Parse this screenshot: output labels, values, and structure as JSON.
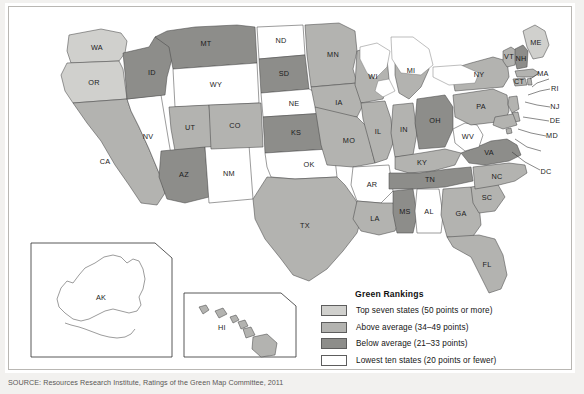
{
  "legend": {
    "title": "Green Rankings",
    "items": [
      {
        "label": "Top seven states (50 points or more)",
        "color": "#d0d0cd",
        "tier": "top7"
      },
      {
        "label": "Above average (34–49 points)",
        "color": "#b3b3b0",
        "tier": "above"
      },
      {
        "label": "Below average (21–33 points)",
        "color": "#8d8d8a",
        "tier": "below"
      },
      {
        "label": "Lowest ten states (20 points or fewer)",
        "color": "#ffffff",
        "tier": "lowest"
      }
    ]
  },
  "source": "SOURCE: Resources Research Institute, Ratings of the Green Map Committee, 2011",
  "insets": [
    {
      "name": "AK",
      "label": "AK"
    },
    {
      "name": "HI",
      "label": "HI"
    }
  ],
  "map": {
    "states": [
      {
        "code": "WA",
        "tier": "top7"
      },
      {
        "code": "OR",
        "tier": "top7"
      },
      {
        "code": "CA",
        "tier": "above"
      },
      {
        "code": "NV",
        "tier": "lowest"
      },
      {
        "code": "ID",
        "tier": "below"
      },
      {
        "code": "MT",
        "tier": "below"
      },
      {
        "code": "WY",
        "tier": "lowest"
      },
      {
        "code": "UT",
        "tier": "above"
      },
      {
        "code": "AZ",
        "tier": "below"
      },
      {
        "code": "NM",
        "tier": "lowest"
      },
      {
        "code": "CO",
        "tier": "above"
      },
      {
        "code": "ND",
        "tier": "lowest"
      },
      {
        "code": "SD",
        "tier": "below"
      },
      {
        "code": "NE",
        "tier": "lowest"
      },
      {
        "code": "KS",
        "tier": "below"
      },
      {
        "code": "OK",
        "tier": "lowest"
      },
      {
        "code": "TX",
        "tier": "above"
      },
      {
        "code": "MN",
        "tier": "above"
      },
      {
        "code": "IA",
        "tier": "above"
      },
      {
        "code": "MO",
        "tier": "above"
      },
      {
        "code": "AR",
        "tier": "lowest"
      },
      {
        "code": "LA",
        "tier": "above"
      },
      {
        "code": "WI",
        "tier": "above"
      },
      {
        "code": "IL",
        "tier": "above"
      },
      {
        "code": "MI",
        "tier": "above"
      },
      {
        "code": "IN",
        "tier": "above"
      },
      {
        "code": "OH",
        "tier": "below"
      },
      {
        "code": "KY",
        "tier": "above"
      },
      {
        "code": "TN",
        "tier": "below"
      },
      {
        "code": "MS",
        "tier": "below"
      },
      {
        "code": "AL",
        "tier": "lowest"
      },
      {
        "code": "GA",
        "tier": "above"
      },
      {
        "code": "FL",
        "tier": "above"
      },
      {
        "code": "SC",
        "tier": "above"
      },
      {
        "code": "NC",
        "tier": "above"
      },
      {
        "code": "VA",
        "tier": "below"
      },
      {
        "code": "WV",
        "tier": "lowest"
      },
      {
        "code": "PA",
        "tier": "above"
      },
      {
        "code": "NY",
        "tier": "above"
      },
      {
        "code": "VT",
        "tier": "above"
      },
      {
        "code": "NH",
        "tier": "below"
      },
      {
        "code": "ME",
        "tier": "top7"
      },
      {
        "code": "MA",
        "tier": "above"
      },
      {
        "code": "CT",
        "tier": "above"
      },
      {
        "code": "RI",
        "tier": "above"
      },
      {
        "code": "NJ",
        "tier": "above"
      },
      {
        "code": "DE",
        "tier": "above"
      },
      {
        "code": "MD",
        "tier": "above"
      },
      {
        "code": "DC",
        "tier": "above"
      },
      {
        "code": "AK",
        "tier": "lowest"
      },
      {
        "code": "HI",
        "tier": "above"
      }
    ]
  }
}
